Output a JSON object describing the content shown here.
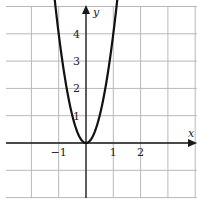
{
  "chart_data": {
    "type": "line",
    "title": "",
    "xlabel": "x",
    "ylabel": "y",
    "function": "y = 4x^2",
    "xlim": [
      -2.9,
      3.9
    ],
    "ylim": [
      -1.9,
      5.0
    ],
    "grid": true,
    "x_ticks": [
      {
        "value": -1,
        "label": "−1"
      },
      {
        "value": 1,
        "label": "1"
      },
      {
        "value": 2,
        "label": "2"
      }
    ],
    "y_ticks": [
      {
        "value": 1,
        "label": "1"
      },
      {
        "value": 2,
        "label": "2"
      },
      {
        "value": 3,
        "label": "3"
      },
      {
        "value": 4,
        "label": "4"
      }
    ],
    "series": [
      {
        "name": "parabola",
        "x": [
          -1.15,
          -1.0,
          -0.75,
          -0.5,
          -0.25,
          0,
          0.25,
          0.5,
          0.75,
          1.0,
          1.15
        ],
        "y": [
          5.29,
          4.0,
          2.25,
          1.0,
          0.25,
          0,
          0.25,
          1.0,
          2.25,
          4.0,
          5.29
        ]
      }
    ]
  },
  "colors": {
    "grid": "#b8b8b8",
    "axis": "#1a1a1a",
    "curve": "#111111"
  }
}
